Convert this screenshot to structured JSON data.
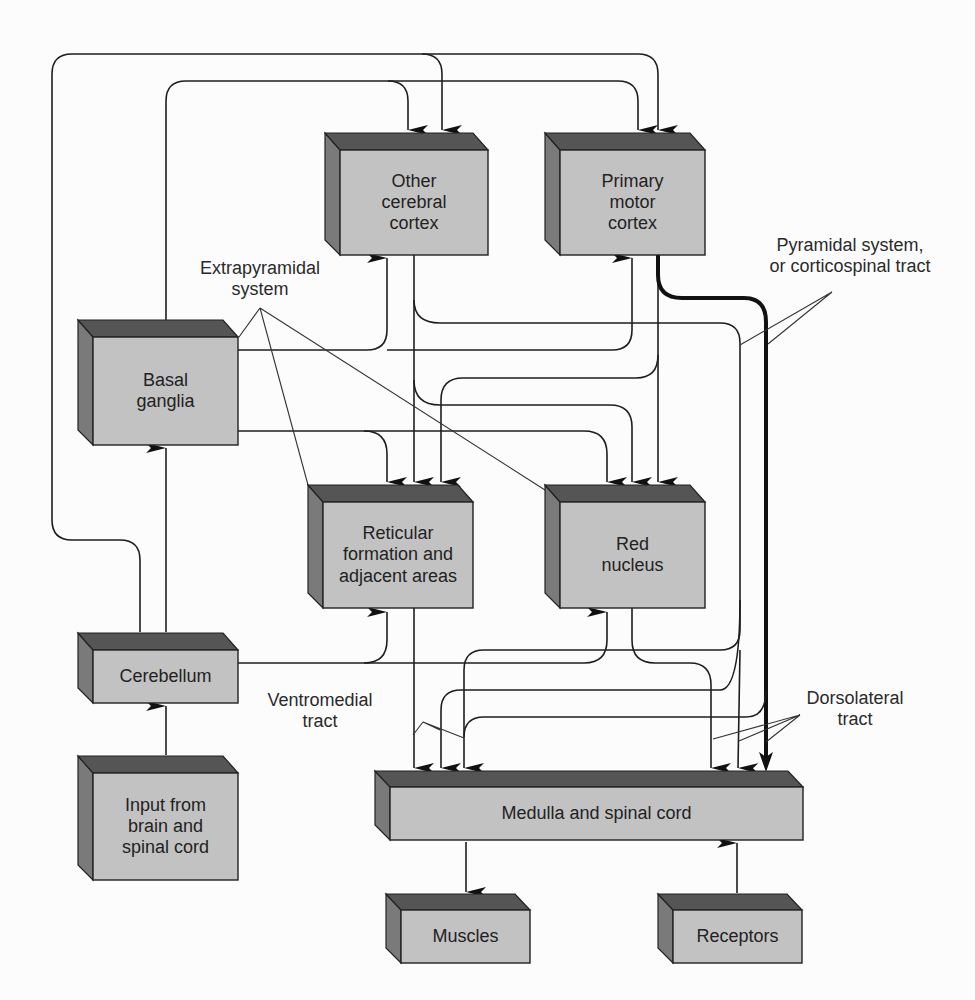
{
  "diagram": {
    "colors": {
      "box_face": "#c2c2c2",
      "box_top": "#555555",
      "box_side": "#7a7a7a",
      "line": "#1e1e1e",
      "background": "#fcfcfc"
    },
    "boxes": {
      "other_cortex": "Other\ncerebral\ncortex",
      "primary_motor": "Primary\nmotor\ncortex",
      "basal_ganglia": "Basal\nganglia",
      "reticular": "Reticular\nformation and\nadjacent areas",
      "red_nucleus": "Red\nnucleus",
      "cerebellum": "Cerebellum",
      "input": "Input from\nbrain and\nspinal cord",
      "medulla": "Medulla and spinal cord",
      "muscles": "Muscles",
      "receptors": "Receptors"
    },
    "annotations": {
      "extrapyramidal": "Extrapyramidal\nsystem",
      "pyramidal": "Pyramidal system,\nor corticospinal tract",
      "ventromedial": "Ventromedial\ntract",
      "dorsolateral": "Dorsolateral\ntract"
    },
    "connections": [
      {
        "from": "Input from brain and spinal cord",
        "to": "Cerebellum"
      },
      {
        "from": "Cerebellum",
        "to": "Basal ganglia"
      },
      {
        "from": "Cerebellum",
        "to": "Other cerebral cortex"
      },
      {
        "from": "Cerebellum",
        "to": "Primary motor cortex"
      },
      {
        "from": "Cerebellum",
        "to": "Reticular formation and adjacent areas"
      },
      {
        "from": "Cerebellum",
        "to": "Red nucleus"
      },
      {
        "from": "Basal ganglia",
        "to": "Other cerebral cortex"
      },
      {
        "from": "Basal ganglia",
        "to": "Primary motor cortex"
      },
      {
        "from": "Basal ganglia",
        "to": "Reticular formation and adjacent areas"
      },
      {
        "from": "Basal ganglia",
        "to": "Red nucleus"
      },
      {
        "from": "Other cerebral cortex",
        "to": "Reticular formation and adjacent areas"
      },
      {
        "from": "Other cerebral cortex",
        "to": "Red nucleus"
      },
      {
        "from": "Other cerebral cortex",
        "to": "Medulla and spinal cord"
      },
      {
        "from": "Primary motor cortex",
        "to": "Reticular formation and adjacent areas"
      },
      {
        "from": "Primary motor cortex",
        "to": "Red nucleus"
      },
      {
        "from": "Primary motor cortex",
        "to": "Medulla and spinal cord",
        "style": "thick"
      },
      {
        "from": "Reticular formation and adjacent areas",
        "to": "Medulla and spinal cord"
      },
      {
        "from": "Red nucleus",
        "to": "Medulla and spinal cord"
      },
      {
        "from": "Medulla and spinal cord",
        "to": "Muscles"
      },
      {
        "from": "Receptors",
        "to": "Medulla and spinal cord"
      }
    ]
  }
}
